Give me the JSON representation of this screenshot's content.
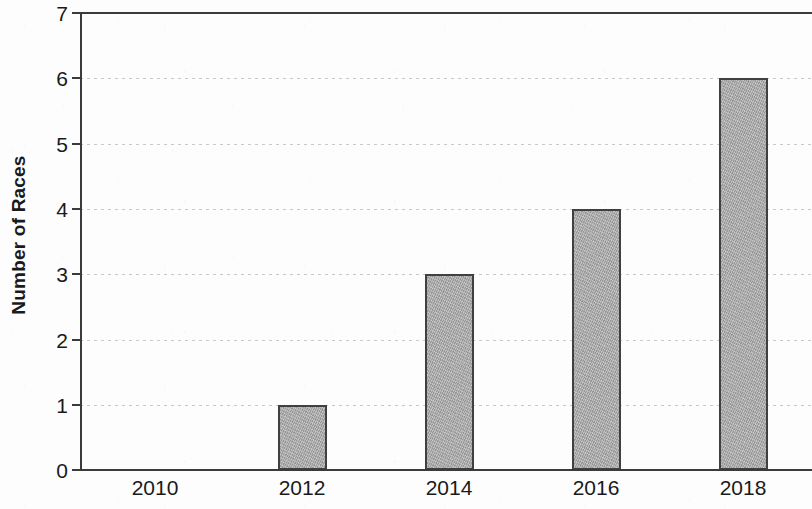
{
  "chart_data": {
    "type": "bar",
    "title": "",
    "subtitle": "",
    "xlabel": "",
    "ylabel": "Number of Races",
    "categories": [
      "2010",
      "2012",
      "2014",
      "2016",
      "2018"
    ],
    "values": [
      0,
      1,
      3,
      4,
      6
    ],
    "series": [
      {
        "name": "Number of Races",
        "values": [
          0,
          1,
          3,
          4,
          6
        ]
      }
    ],
    "ylim": [
      0,
      7
    ],
    "ytick_labels": [
      "0",
      "1",
      "2",
      "3",
      "4",
      "5",
      "6",
      "7"
    ],
    "ytick_values": [
      0,
      1,
      2,
      3,
      4,
      5,
      6,
      7
    ],
    "xtick_labels": [
      "2010",
      "2012",
      "2014",
      "2016",
      "2018"
    ],
    "grid": true,
    "grid_axis": "y",
    "legend": false,
    "legend_position": "none",
    "annotations": [],
    "colors": {
      "bar_fill": "#a9a9a9",
      "bar_edge": "#404040",
      "axis": "#3b3b3b",
      "grid": "#9e9ea3",
      "text": "#1a1a1a",
      "background": "#fdfdfd"
    }
  }
}
